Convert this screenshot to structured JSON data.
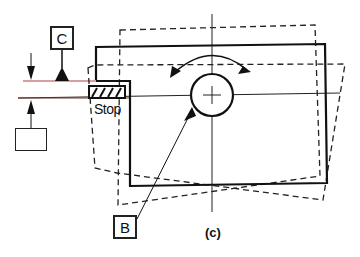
{
  "figure": {
    "caption": "(c)",
    "labels": {
      "datum_c": "C",
      "datum_b": "B",
      "stop": "Stop",
      "empty_box": ""
    },
    "colors": {
      "ink": "#1a1a1a",
      "red_line": "#b04040",
      "background": "#ffffff"
    },
    "elements": [
      "part-rectangle-solid",
      "rotated-rectangle-dashed-ccw",
      "rotated-rectangle-dashed-cw",
      "circular-hole-with-center-cross",
      "rotation-arrow-arc",
      "stop-block-hatched",
      "datum-triangle-c",
      "datum-triangle-b-leader",
      "dimension-arrows"
    ]
  }
}
